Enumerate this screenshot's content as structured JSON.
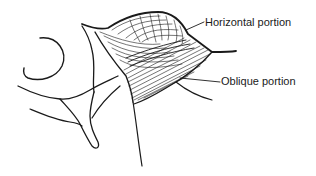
{
  "figure": {
    "labels": {
      "horizontal": "Horizontal portion",
      "oblique": "Oblique portion"
    },
    "colors": {
      "ink": "#1a1a1a",
      "background": "#ffffff"
    }
  }
}
